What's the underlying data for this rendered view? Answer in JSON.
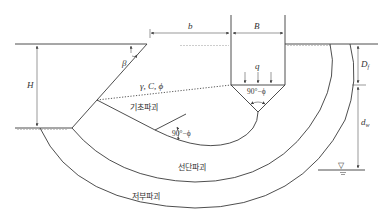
{
  "figure": {
    "dimensions": {
      "b": "b",
      "B": "B",
      "H": "H",
      "Df": "D",
      "Df_sub": "f",
      "dw": "d",
      "dw_sub": "w"
    },
    "soil_params": "γ, C, ϕ",
    "load": "q",
    "angles": {
      "beta": "β",
      "wedge_angle": "90°−ϕ",
      "radial_angle": "90°−ϕ"
    },
    "failure_zones": {
      "base": "기초파괴",
      "toe": "선단파괴",
      "deep": "저부파괴"
    },
    "water_table_symbol": "▽"
  }
}
